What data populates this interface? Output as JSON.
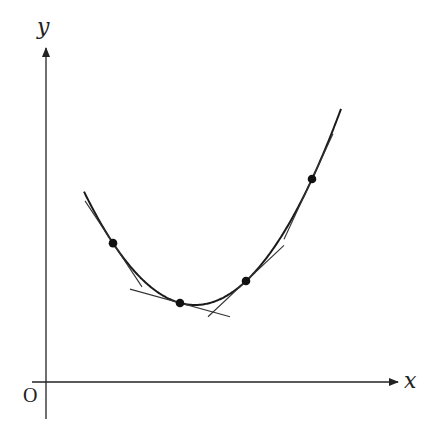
{
  "diagram": {
    "axes": {
      "x_label": "x",
      "y_label": "y",
      "origin_label": "O"
    },
    "curve": {
      "type": "parabola",
      "vertex_px": [
        195,
        305
      ],
      "coef": 0.0092,
      "x_start_px": 84,
      "x_end_px": 341
    },
    "points": [
      {
        "id": "P1",
        "x": 113,
        "tangent_from": 85,
        "tangent_to": 142
      },
      {
        "id": "P2",
        "x": 180,
        "tangent_from": 130,
        "tangent_to": 230
      },
      {
        "id": "P3",
        "x": 246,
        "tangent_from": 208,
        "tangent_to": 284
      },
      {
        "id": "P4",
        "x": 312,
        "tangent_from": 284,
        "tangent_to": 333
      }
    ]
  }
}
